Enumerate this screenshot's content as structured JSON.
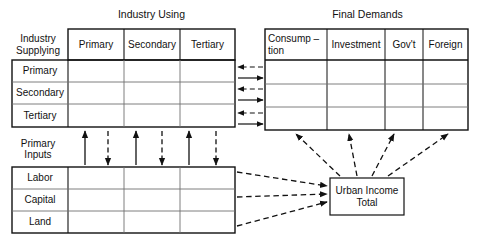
{
  "diagram": {
    "type": "input-output-table-flow-diagram",
    "titles": {
      "industry_using": "Industry Using",
      "final_demands": "Final Demands"
    },
    "corner_label": "Industry\nSupplying",
    "primary_inputs_label": "Primary\nInputs",
    "industry_using_columns": [
      "Primary",
      "Secondary",
      "Tertiary"
    ],
    "industry_supplying_rows": [
      "Primary",
      "Secondary",
      "Tertiary"
    ],
    "final_demands_columns": [
      "Consump –\ntion",
      "Investment",
      "Gov't",
      "Foreign"
    ],
    "primary_inputs_rows": [
      "Labor",
      "Capital",
      "Land"
    ],
    "node": {
      "urban_income_total": "Urban Income\nTotal"
    },
    "colors": {
      "stroke": "#111111",
      "grid": "#6f6f6f",
      "background": "#ffffff"
    },
    "flows": {
      "interindustry_to_final_demand": "solid right arrows (3)",
      "final_demand_to_interindustry": "dashed left arrows (3)",
      "primary_inputs_to_industry": "solid up arrows (3)",
      "industry_to_primary_inputs": "dashed down arrows (3)",
      "primary_inputs_to_urban_income": "dashed right arrows (3)",
      "urban_income_to_final_demands": "dashed up arrows (4)"
    }
  }
}
